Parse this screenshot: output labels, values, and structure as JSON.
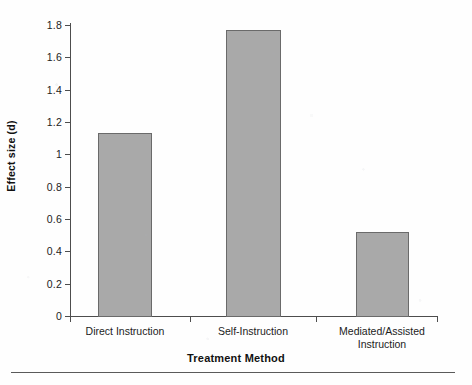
{
  "chart_data": {
    "type": "bar",
    "title": "",
    "categories": [
      "Direct Instruction",
      "Self-Instruction",
      "Mediated/Assisted\nInstruction"
    ],
    "values": [
      1.13,
      1.77,
      0.52
    ],
    "xlabel": "Treatment Method",
    "ylabel": "Effect size (d)",
    "ylim": [
      0,
      1.8
    ],
    "ytick_labels": [
      "1.8",
      "1.6",
      "1.4",
      "1.2",
      "1",
      "0.8",
      "0.6",
      "0.4",
      "0.2",
      "0"
    ],
    "ytick_values": [
      1.8,
      1.6,
      1.4,
      1.2,
      1.0,
      0.8,
      0.6,
      0.4,
      0.2,
      0
    ],
    "grid": false,
    "legend": false,
    "legend_position": "none",
    "bar_fill_color": "#a9a9a9",
    "bar_border_color": "#6a6a6a",
    "axis_color": "#4d4d4d",
    "background_color": "#fefefe"
  },
  "figure": {
    "bottom_rule": "",
    "y_axis_label": "Effect size (d)",
    "x_axis_label": "Treatment Method"
  }
}
